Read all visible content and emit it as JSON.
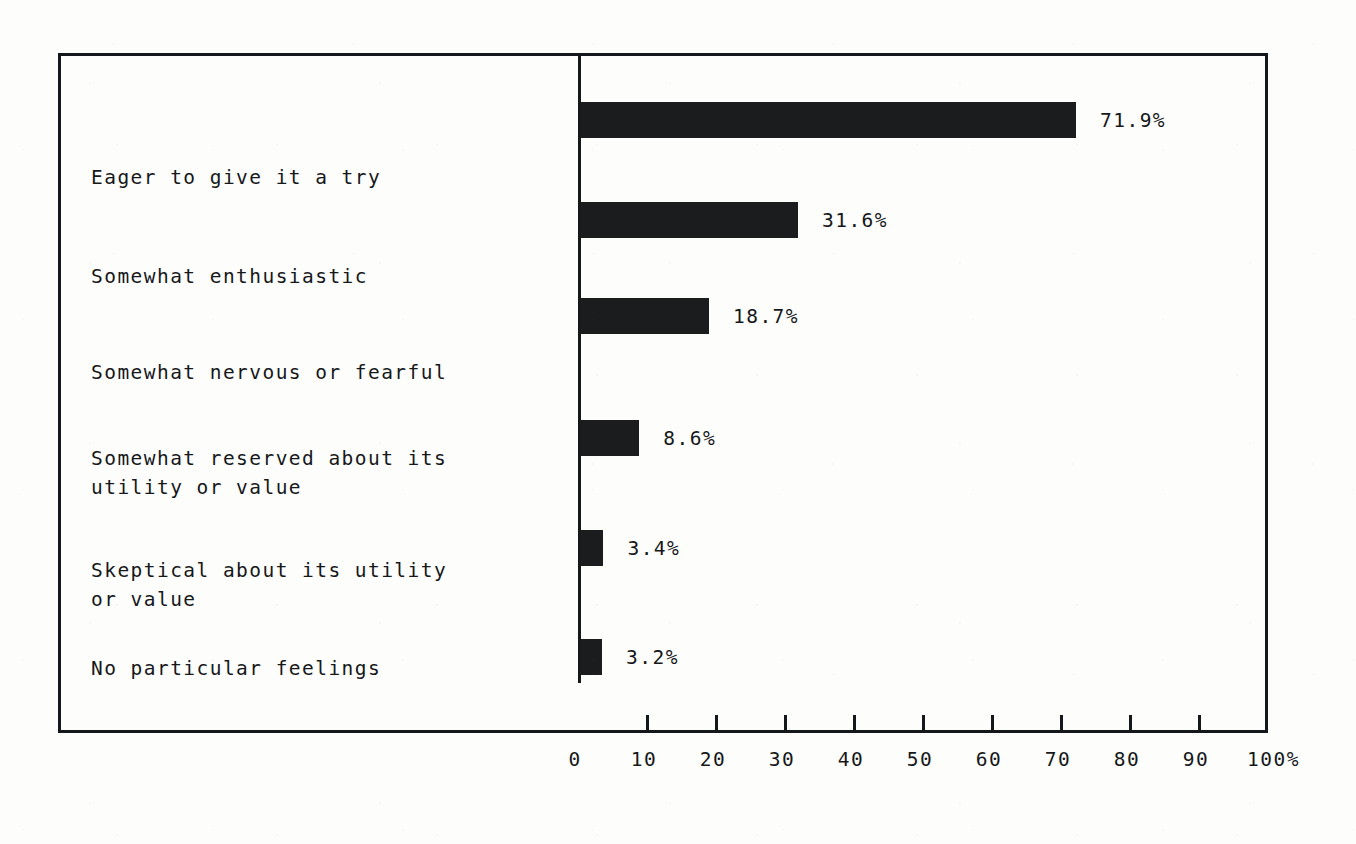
{
  "figure": {
    "kind": "horizontal-bar-chart",
    "paper_color": "#fdfdfc",
    "ink_color": "#16181a",
    "bar_color": "#1b1c1e"
  },
  "chart_data": {
    "type": "bar",
    "orientation": "horizontal",
    "title": "",
    "subtitle": "",
    "xlabel": "",
    "ylabel": "",
    "categories": [
      "Eager to give it a try",
      "Somewhat enthusiastic",
      "Somewhat nervous or fearful",
      "Somewhat reserved about its\nutility or value",
      "Skeptical about its utility\nor value",
      "No particular feelings"
    ],
    "values": [
      71.9,
      31.6,
      18.7,
      8.6,
      3.4,
      3.2
    ],
    "value_labels": [
      "71.9%",
      "31.6%",
      "18.7%",
      "8.6%",
      "3.4%",
      "3.2%"
    ],
    "xlim": [
      0,
      100
    ],
    "xticks": [
      0,
      10,
      20,
      30,
      40,
      50,
      60,
      70,
      80,
      90,
      100
    ],
    "xtick_labels": [
      "0",
      "10",
      "20",
      "30",
      "40",
      "50",
      "60",
      "70",
      "80",
      "90",
      "100%"
    ],
    "grid": false,
    "legend": null,
    "frame": true
  }
}
